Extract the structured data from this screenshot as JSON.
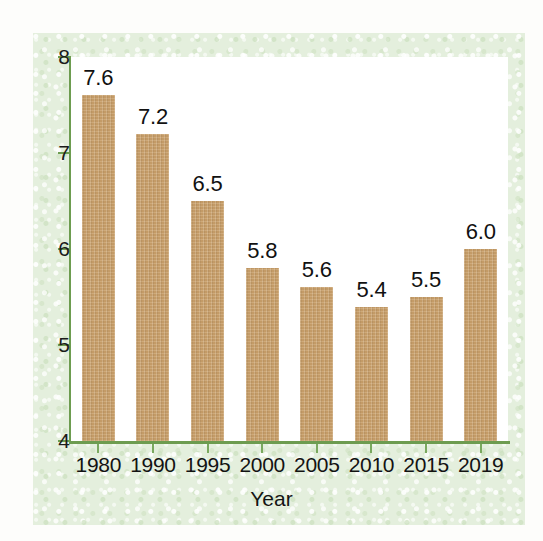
{
  "chart_data": {
    "type": "bar",
    "title": "",
    "xlabel": "Year",
    "ylabel": "",
    "categories": [
      "1980",
      "1990",
      "1995",
      "2000",
      "2005",
      "2010",
      "2015",
      "2019"
    ],
    "values": [
      7.6,
      7.2,
      6.5,
      5.8,
      5.6,
      5.4,
      5.5,
      6.0
    ],
    "data_labels": [
      "7.6",
      "7.2",
      "6.5",
      "5.8",
      "5.6",
      "5.4",
      "5.5",
      "6.0"
    ],
    "ylim": [
      4,
      8
    ],
    "yticks": [
      4,
      5,
      6,
      7,
      8
    ],
    "ytick_labels": [
      "4",
      "5",
      "6",
      "7",
      "8"
    ],
    "grid": false,
    "legend": null,
    "bar_color": "#c9a06b",
    "axis_color": "#6d9c50",
    "panel_color": "#e4efdd",
    "plot_bg_color": "#ffffff",
    "label_color": "#111111"
  },
  "axis": {
    "x_title": "Year"
  }
}
